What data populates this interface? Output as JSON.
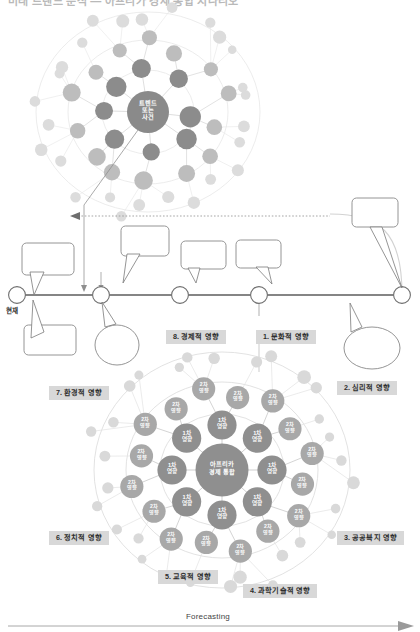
{
  "header": {
    "title": "미래 트렌드 분석 — 아프리카 경제 통합 시나리오"
  },
  "network": {
    "center_label_lines": [
      "트렌드",
      "또는",
      "사건"
    ],
    "node_color_dark": "#8c8c8c",
    "node_color_mid": "#bdbdbd",
    "node_color_light": "#dcdcdc",
    "center_color": "#8a8a8a"
  },
  "timeline": {
    "present_label": "현재",
    "node_count": 5,
    "tags": [
      {
        "id": "tag-economic",
        "label": "8. 경제적 영향"
      },
      {
        "id": "tag-cultural",
        "label": "1. 문화적 영향"
      }
    ]
  },
  "radial": {
    "center_lines": [
      "아프리카",
      "경제 통합"
    ],
    "primary_label_lines": [
      "1차",
      "영향"
    ],
    "secondary_label_lines": [
      "2차",
      "영향"
    ],
    "primary_count": 8,
    "secondary_count": 16,
    "tags": [
      {
        "id": "tag-psychological",
        "label": "2. 심리적 영향"
      },
      {
        "id": "tag-welfare",
        "label": "3. 공공복지 영향"
      },
      {
        "id": "tag-scitech",
        "label": "4. 과학기술적 영향"
      },
      {
        "id": "tag-education",
        "label": "5. 교육적 영향"
      },
      {
        "id": "tag-political",
        "label": "6. 정치적 영향"
      },
      {
        "id": "tag-environmental",
        "label": "7. 환경적 영향"
      }
    ],
    "center_color": "#8f8f8f",
    "primary_color": "#8f8f8f",
    "secondary_color": "#a8a8a8",
    "outer_color": "#d9d9d9"
  },
  "footer": {
    "forecasting_label": "Forecasting"
  }
}
